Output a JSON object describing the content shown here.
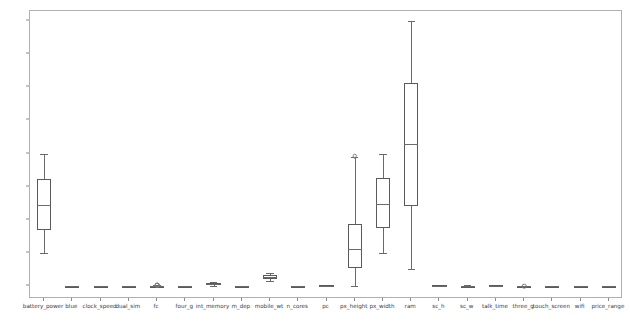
{
  "figure": {
    "background_color": "#ffffff",
    "axes_edge_color": "#b0b0b0",
    "box_line_color": "#5a5a5a",
    "title": "",
    "xlabel": "",
    "ylabel": ""
  },
  "axis": {
    "y_ticks": [
      0,
      500,
      1000,
      1500,
      2000,
      2500,
      3000,
      3500,
      4000
    ],
    "y_tick_labels": [
      "0",
      "500",
      "1000",
      "1500",
      "2000",
      "2500",
      "3000",
      "3500",
      "4000"
    ],
    "ylim": [
      -190,
      4150
    ],
    "grid": false
  },
  "chart_data": {
    "type": "box",
    "title": "",
    "xlabel": "",
    "ylabel": "",
    "ylim": [
      -190,
      4150
    ],
    "grid": false,
    "categories": [
      "battery_power",
      "blue",
      "clock_speed",
      "dual_sim",
      "fc",
      "four_g",
      "int_memory",
      "m_dep",
      "mobile_wt",
      "n_cores",
      "pc",
      "px_height",
      "px_width",
      "ram",
      "sc_h",
      "sc_w",
      "talk_time",
      "three_g",
      "touch_screen",
      "wifi",
      "price_range"
    ],
    "boxes": [
      {
        "name": "battery_power",
        "whisker_low": 501,
        "q1": 855,
        "median": 1226,
        "q3": 1615,
        "whisker_high": 1998,
        "fliers": []
      },
      {
        "name": "blue",
        "whisker_low": 0,
        "q1": 0,
        "median": 0,
        "q3": 1,
        "whisker_high": 1,
        "fliers": []
      },
      {
        "name": "clock_speed",
        "whisker_low": 0.5,
        "q1": 0.7,
        "median": 1.5,
        "q3": 2.2,
        "whisker_high": 3.0,
        "fliers": []
      },
      {
        "name": "dual_sim",
        "whisker_low": 0,
        "q1": 0,
        "median": 1,
        "q3": 1,
        "whisker_high": 1,
        "fliers": []
      },
      {
        "name": "fc",
        "whisker_low": 0,
        "q1": 1,
        "median": 3,
        "q3": 7,
        "whisker_high": 16,
        "fliers": [
          17,
          18,
          19
        ]
      },
      {
        "name": "four_g",
        "whisker_low": 0,
        "q1": 0,
        "median": 1,
        "q3": 1,
        "whisker_high": 1,
        "fliers": []
      },
      {
        "name": "int_memory",
        "whisker_low": 2,
        "q1": 16,
        "median": 32,
        "q3": 48,
        "whisker_high": 64,
        "fliers": []
      },
      {
        "name": "m_dep",
        "whisker_low": 0.1,
        "q1": 0.2,
        "median": 0.5,
        "q3": 0.8,
        "whisker_high": 1.0,
        "fliers": []
      },
      {
        "name": "mobile_wt",
        "whisker_low": 80,
        "q1": 109,
        "median": 141,
        "q3": 170,
        "whisker_high": 200,
        "fliers": []
      },
      {
        "name": "n_cores",
        "whisker_low": 1,
        "q1": 2,
        "median": 4,
        "q3": 6,
        "whisker_high": 8,
        "fliers": []
      },
      {
        "name": "pc",
        "whisker_low": 0,
        "q1": 5,
        "median": 10,
        "q3": 15,
        "whisker_high": 20,
        "fliers": []
      },
      {
        "name": "px_height",
        "whisker_low": 0,
        "q1": 282,
        "median": 564,
        "q3": 947,
        "whisker_high": 1944,
        "fliers": [
          1960
        ]
      },
      {
        "name": "px_width",
        "whisker_low": 500,
        "q1": 874,
        "median": 1247,
        "q3": 1633,
        "whisker_high": 1998,
        "fliers": []
      },
      {
        "name": "ram",
        "whisker_low": 256,
        "q1": 1208,
        "median": 2146,
        "q3": 3064,
        "whisker_high": 3998,
        "fliers": []
      },
      {
        "name": "sc_h",
        "whisker_low": 5,
        "q1": 9,
        "median": 12,
        "q3": 16,
        "whisker_high": 19,
        "fliers": []
      },
      {
        "name": "sc_w",
        "whisker_low": 0,
        "q1": 2,
        "median": 5,
        "q3": 9,
        "whisker_high": 18,
        "fliers": []
      },
      {
        "name": "talk_time",
        "whisker_low": 2,
        "q1": 6,
        "median": 11,
        "q3": 16,
        "whisker_high": 20,
        "fliers": []
      },
      {
        "name": "three_g",
        "whisker_low": 0,
        "q1": 1,
        "median": 1,
        "q3": 1,
        "whisker_high": 1,
        "fliers": [
          0
        ]
      },
      {
        "name": "touch_screen",
        "whisker_low": 0,
        "q1": 0,
        "median": 1,
        "q3": 1,
        "whisker_high": 1,
        "fliers": []
      },
      {
        "name": "wifi",
        "whisker_low": 0,
        "q1": 0,
        "median": 1,
        "q3": 1,
        "whisker_high": 1,
        "fliers": []
      },
      {
        "name": "price_range",
        "whisker_low": 0,
        "q1": 0,
        "median": 1.5,
        "q3": 2,
        "whisker_high": 3,
        "fliers": []
      }
    ]
  }
}
